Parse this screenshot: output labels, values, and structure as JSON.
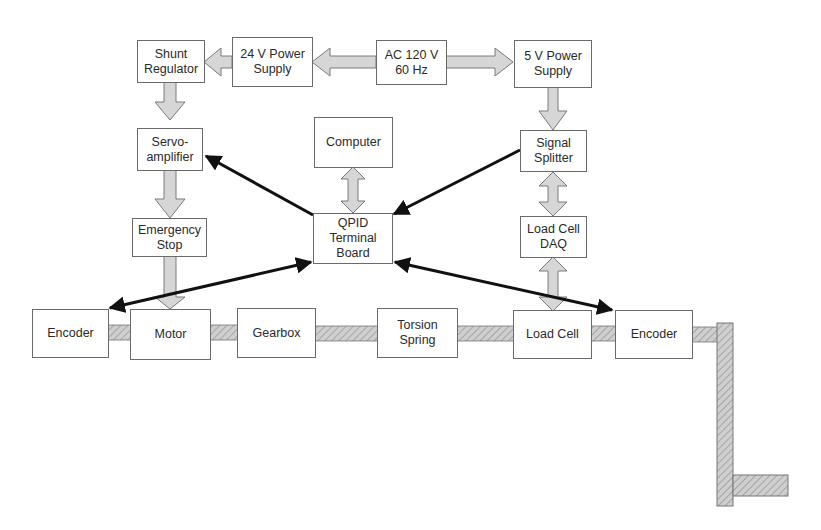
{
  "diagram": {
    "type": "block-diagram",
    "colors": {
      "box_border": "#6a6a6a",
      "power_arrow_fill": "#d4d4d4",
      "power_arrow_stroke": "#7a7a7a",
      "signal_arrow": "#111111",
      "shaft_fill": "#c8c8c8",
      "shaft_hatch": "#9a9a9a"
    },
    "blocks": {
      "shunt_regulator": "Shunt\nRegulator",
      "power_24v": "24 V Power\nSupply",
      "ac_source": "AC 120 V\n60 Hz",
      "power_5v": "5 V Power\nSupply",
      "servo_amplifier": "Servo-\namplifier",
      "computer": "Computer",
      "signal_splitter": "Signal\nSplitter",
      "emergency_stop": "Emergency\nStop",
      "qpid_board": "QPID\nTerminal\nBoard",
      "load_cell_daq": "Load Cell\nDAQ",
      "encoder_left": "Encoder",
      "motor": "Motor",
      "gearbox": "Gearbox",
      "torsion_spring": "Torsion\nSpring",
      "load_cell": "Load Cell",
      "encoder_right": "Encoder"
    },
    "power_connections": [
      {
        "from": "AC 120 V 60 Hz",
        "to": "24 V Power Supply"
      },
      {
        "from": "AC 120 V 60 Hz",
        "to": "5 V Power Supply"
      },
      {
        "from": "24 V Power Supply",
        "to": "Shunt Regulator"
      },
      {
        "from": "Shunt Regulator",
        "to": "Servo-amplifier"
      },
      {
        "from": "Servo-amplifier",
        "to": "Emergency Stop"
      },
      {
        "from": "Emergency Stop",
        "to": "Motor"
      },
      {
        "from": "5 V Power Supply",
        "to": "Signal Splitter"
      },
      {
        "from": "Signal Splitter",
        "to": "Load Cell DAQ",
        "bidirectional": true
      },
      {
        "from": "Load Cell DAQ",
        "to": "Load Cell",
        "bidirectional": true
      },
      {
        "from": "Computer",
        "to": "QPID Terminal Board",
        "bidirectional": true
      }
    ],
    "signal_connections": [
      {
        "from": "QPID Terminal Board",
        "to": "Servo-amplifier"
      },
      {
        "from": "Signal Splitter",
        "to": "QPID Terminal Board"
      },
      {
        "from": "QPID Terminal Board",
        "to": "Encoder (left)",
        "bidirectional": true
      },
      {
        "from": "QPID Terminal Board",
        "to": "Encoder (right)",
        "bidirectional": true
      }
    ],
    "mechanical_shaft": [
      "Encoder",
      "Motor",
      "Gearbox",
      "Torsion Spring",
      "Load Cell",
      "Encoder",
      "Link arm"
    ]
  }
}
